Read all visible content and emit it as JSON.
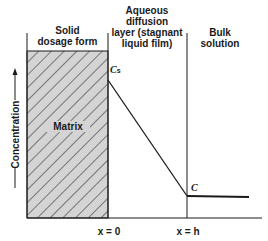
{
  "diagram": {
    "regions": [
      {
        "name": "solid-dosage-form",
        "label": "Solid dosage form"
      },
      {
        "name": "aqueous-diffusion-layer",
        "label": "Aqueous diffusion layer (stagnant liquid film)"
      },
      {
        "name": "bulk-solution",
        "label": "Bulk solution"
      }
    ],
    "labels": {
      "solid_line1": "Solid",
      "solid_line2": "dosage form",
      "aq_line1": "Aqueous",
      "aq_line2": "diffusion",
      "aq_line3": "layer (stagnant",
      "aq_line4": "liquid film)",
      "bulk_line1": "Bulk",
      "bulk_line2": "solution",
      "matrix": "Matrix",
      "y_axis": "Concentration",
      "cs": "C",
      "cs_sub": "s",
      "c": "C",
      "x0": "x = 0",
      "xh": "x = h"
    },
    "colors": {
      "line": "#1a1a1a",
      "hatch_fill": "#d4d4d4"
    }
  }
}
